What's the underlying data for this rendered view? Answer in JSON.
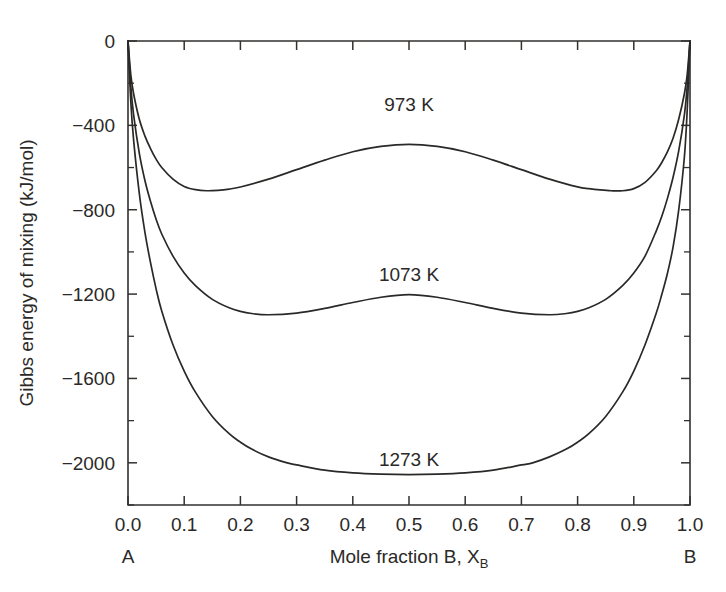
{
  "chart_data": {
    "type": "line",
    "title": "",
    "xlabel": "Mole fraction B, X_B",
    "xlabel_main": "Mole fraction B, X",
    "xlabel_sub": "B",
    "ylabel": "Gibbs energy of mixing (kJ/mol)",
    "xlim": [
      0,
      1
    ],
    "ylim": [
      -2200,
      0
    ],
    "grid": false,
    "legend_position": "inline-annotations",
    "x_endpoint_left": "A",
    "x_endpoint_right": "B",
    "x_ticks": [
      0,
      0.1,
      0.2,
      0.3,
      0.4,
      0.5,
      0.6,
      0.7,
      0.8,
      0.9,
      1
    ],
    "x_tick_labels": [
      "0.0",
      "0.1",
      "0.2",
      "0.3",
      "0.4",
      "0.5",
      "0.6",
      "0.7",
      "0.8",
      "0.9",
      "1.0"
    ],
    "y_ticks": [
      0,
      -400,
      -800,
      -1200,
      -1600,
      -2000
    ],
    "y_tick_labels": [
      "0",
      "−400",
      "−800",
      "−1200",
      "−1600",
      "−2000"
    ],
    "y_minor_ticks": [
      -200,
      -600,
      -1000,
      -1400,
      -1800,
      -2200
    ],
    "line_color": "#2b2927",
    "axis_color": "#33312f",
    "background_color": "#ffffff",
    "series": [
      {
        "name": "973 K",
        "label": "973 K",
        "label_x": 0.5,
        "label_y": -300,
        "x": [
          0,
          0.005,
          0.01,
          0.02,
          0.03,
          0.04,
          0.05,
          0.06,
          0.08,
          0.1,
          0.12,
          0.14,
          0.16,
          0.18,
          0.2,
          0.25,
          0.3,
          0.35,
          0.4,
          0.45,
          0.5,
          0.55,
          0.6,
          0.65,
          0.7,
          0.75,
          0.8,
          0.82,
          0.84,
          0.86,
          0.88,
          0.9,
          0.92,
          0.94,
          0.95,
          0.96,
          0.97,
          0.98,
          0.99,
          0.995,
          1.0
        ],
        "y": [
          0,
          -160,
          -250,
          -370,
          -450,
          -510,
          -560,
          -600,
          -655,
          -690,
          -705,
          -710,
          -708,
          -702,
          -692,
          -655,
          -610,
          -565,
          -525,
          -500,
          -490,
          -500,
          -525,
          -565,
          -610,
          -655,
          -692,
          -700,
          -706,
          -710,
          -710,
          -700,
          -670,
          -615,
          -575,
          -525,
          -460,
          -370,
          -250,
          -160,
          0
        ]
      },
      {
        "name": "1073 K",
        "label": "1073 K",
        "label_x": 0.5,
        "label_y": -1105,
        "x": [
          0,
          0.005,
          0.01,
          0.02,
          0.03,
          0.04,
          0.05,
          0.06,
          0.08,
          0.1,
          0.12,
          0.15,
          0.18,
          0.2,
          0.22,
          0.25,
          0.3,
          0.35,
          0.4,
          0.45,
          0.5,
          0.55,
          0.6,
          0.65,
          0.7,
          0.75,
          0.78,
          0.8,
          0.82,
          0.85,
          0.88,
          0.9,
          0.92,
          0.94,
          0.95,
          0.96,
          0.97,
          0.98,
          0.99,
          0.995,
          1.0
        ],
        "y": [
          0,
          -215,
          -350,
          -530,
          -660,
          -760,
          -845,
          -915,
          -1020,
          -1100,
          -1160,
          -1225,
          -1265,
          -1282,
          -1292,
          -1298,
          -1290,
          -1268,
          -1240,
          -1215,
          -1203,
          -1215,
          -1240,
          -1268,
          -1290,
          -1298,
          -1292,
          -1282,
          -1265,
          -1225,
          -1160,
          -1100,
          -1020,
          -900,
          -830,
          -745,
          -645,
          -520,
          -350,
          -215,
          0
        ]
      },
      {
        "name": "1273 K",
        "label": "1273 K",
        "label_x": 0.5,
        "label_y": -1980,
        "x": [
          0,
          0.005,
          0.01,
          0.02,
          0.03,
          0.04,
          0.05,
          0.06,
          0.08,
          0.1,
          0.12,
          0.15,
          0.18,
          0.2,
          0.22,
          0.25,
          0.28,
          0.3,
          0.35,
          0.4,
          0.45,
          0.5,
          0.55,
          0.6,
          0.65,
          0.7,
          0.72,
          0.75,
          0.78,
          0.8,
          0.82,
          0.85,
          0.88,
          0.9,
          0.92,
          0.94,
          0.95,
          0.96,
          0.97,
          0.98,
          0.99,
          0.995,
          1.0
        ],
        "y": [
          0,
          -290,
          -470,
          -720,
          -905,
          -1050,
          -1175,
          -1280,
          -1440,
          -1565,
          -1665,
          -1780,
          -1862,
          -1902,
          -1935,
          -1972,
          -1998,
          -2010,
          -2035,
          -2048,
          -2054,
          -2056,
          -2054,
          -2048,
          -2035,
          -2010,
          -2000,
          -1972,
          -1935,
          -1902,
          -1862,
          -1780,
          -1665,
          -1565,
          -1440,
          -1290,
          -1200,
          -1100,
          -975,
          -800,
          -550,
          -330,
          0
        ]
      }
    ]
  },
  "layout": {
    "plot_left_px": 128,
    "plot_right_px": 690,
    "plot_top_px": 41,
    "plot_bottom_px": 505
  }
}
